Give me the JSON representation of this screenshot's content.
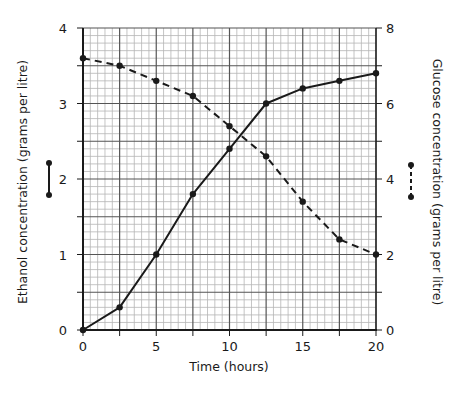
{
  "chart_data": {
    "type": "line",
    "title": "",
    "xlabel": "Time (hours)",
    "ylabel_left": "Ethanol concentration (grams per litre)",
    "ylabel_right": "Glucose concentration (grams per litre)",
    "x": [
      0,
      2.5,
      5,
      7.5,
      10,
      12.5,
      15,
      17.5,
      20
    ],
    "xlim": [
      0,
      20
    ],
    "xticks": [
      0,
      5,
      10,
      15,
      20
    ],
    "ylim_left": [
      0,
      4
    ],
    "yticks_left": [
      0,
      1,
      2,
      3,
      4
    ],
    "ylim_right": [
      0,
      8
    ],
    "yticks_right": [
      0,
      2,
      4,
      6,
      8
    ],
    "grid": true,
    "series": [
      {
        "name": "Ethanol",
        "axis": "left",
        "style": "solid",
        "values": [
          0,
          0.3,
          1.0,
          1.8,
          2.4,
          3.0,
          3.2,
          3.3,
          3.4
        ]
      },
      {
        "name": "Glucose",
        "axis": "right",
        "style": "dashed",
        "values": [
          7.2,
          7.0,
          6.6,
          6.2,
          5.4,
          4.6,
          3.4,
          2.4,
          2.0
        ]
      }
    ],
    "legend": {
      "position": "beside axis titles",
      "entries": [
        {
          "series": "Ethanol",
          "glyph": "solid line with end dots",
          "side": "left"
        },
        {
          "series": "Glucose",
          "glyph": "dashed line with end dots",
          "side": "right"
        }
      ]
    }
  },
  "colors": {
    "line": "#1a1a1a",
    "major_grid": "#555555",
    "minor_grid": "#b5b5b5"
  }
}
